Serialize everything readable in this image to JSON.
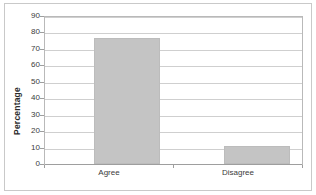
{
  "chart_data": {
    "type": "bar",
    "title": "",
    "subtitle": "",
    "categories": [
      "Agree",
      "Disagree"
    ],
    "values": [
      78,
      11
    ],
    "series": [
      {
        "name": "Percentage",
        "values": [
          78,
          11
        ]
      }
    ],
    "xlabel": "",
    "ylabel": "Percentage",
    "ylim": [
      0,
      90
    ],
    "yticks": [
      0,
      10,
      20,
      30,
      40,
      50,
      60,
      70,
      80,
      90
    ],
    "ytick_labels": [
      "0",
      "10",
      "20",
      "30",
      "40",
      "50",
      "60",
      "70",
      "80",
      "90"
    ],
    "grid": true,
    "grid_axis": "y",
    "legend": false,
    "legend_position": "none",
    "bar_color": "#c4c4c4",
    "bar_edge_color": "#bcbcbc",
    "gridline_color": "#cfcfcf",
    "axis_color": "#9e9e9e",
    "plot_border_color": "#b9b9b9",
    "frame_border_color": "#c9c9c9",
    "background_color": "#ffffff",
    "text_color": "#3b3b3b"
  }
}
